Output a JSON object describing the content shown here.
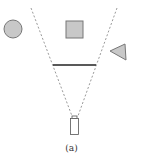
{
  "figure": {
    "caption": "(a)",
    "shapes": [
      {
        "name": "circle",
        "fill": "#c8c8c8",
        "stroke": "#777777"
      },
      {
        "name": "square",
        "fill": "#c8c8c8",
        "stroke": "#777777"
      },
      {
        "name": "triangle",
        "fill": "#c8c8c8",
        "stroke": "#777777"
      }
    ],
    "occluder": {
      "name": "barrier-line",
      "color": "#222222"
    },
    "camera": {
      "name": "camera-device",
      "stroke": "#555555"
    },
    "field_of_view": {
      "style": "dashed",
      "color": "#999999"
    }
  }
}
